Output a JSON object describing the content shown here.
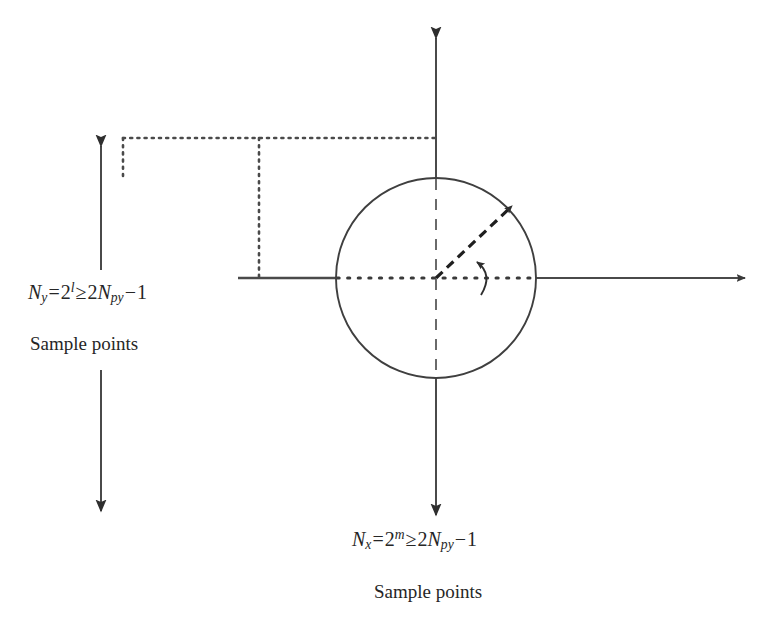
{
  "figure": {
    "name": "sampling-grid-circle-diagram",
    "background_color": "#ffffff",
    "line_color": "#3a3a3a",
    "text_color": "#262626"
  },
  "labels": {
    "y_axis_formula": {
      "name": "N_y = 2^l >= 2N_py - 1",
      "variable": "N",
      "variable_sub": "y",
      "equals": "=",
      "base": "2",
      "exponent": "l",
      "relation": "≥",
      "rhs_coefficient": "2",
      "rhs_variable": "N",
      "rhs_sub": "py",
      "minus": "−",
      "rhs_constant": "1"
    },
    "y_axis_caption": "Sample points",
    "x_axis_formula": {
      "name": "N_x = 2^m >= 2N_py - 1",
      "variable": "N",
      "variable_sub": "x",
      "equals": "=",
      "base": "2",
      "exponent": "m",
      "relation": "≥",
      "rhs_coefficient": "2",
      "rhs_variable": "N",
      "rhs_sub": "py",
      "minus": "−",
      "rhs_constant": "1"
    },
    "x_axis_caption": "Sample points"
  },
  "geometry": {
    "circle": {
      "cx": 436,
      "cy": 278,
      "r": 100
    },
    "origin": {
      "x": 436,
      "y": 278
    },
    "x_axis": {
      "start_x": 238,
      "end_x": 752,
      "y": 278,
      "arrow": "right"
    },
    "y_axis": {
      "x": 436,
      "top_y": 31,
      "bottom_y": 522,
      "arrows": "both"
    },
    "radius_vector": {
      "from_x": 436,
      "from_y": 278,
      "to_x": 517,
      "to_y": 201,
      "style": "dashed",
      "arrow": "end"
    },
    "angle_arc": {
      "cx": 436,
      "cy": 278,
      "radius": 42,
      "from_deg": 0,
      "to_deg": 43
    },
    "bracket": {
      "top_dotted_y": 138,
      "top_dotted_from_x": 123,
      "top_dotted_to_x": 436,
      "left_stub_x": 123,
      "left_stub_to_y": 181,
      "drop_line_x": 259,
      "drop_line_to_y": 278
    },
    "measure_arrow": {
      "x": 101,
      "upper_head_y": 139,
      "upper_tail_y": 270,
      "lower_tail_y": 370,
      "lower_head_y": 518
    }
  }
}
